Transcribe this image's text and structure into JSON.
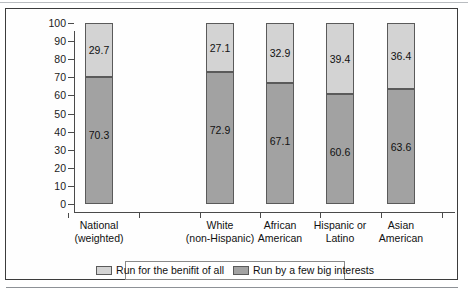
{
  "chart_data": {
    "type": "bar",
    "subtype": "stacked-100-percent",
    "title": "",
    "xlabel": "",
    "ylabel": "",
    "ylim": [
      0,
      100
    ],
    "y_ticks": [
      0,
      10,
      20,
      30,
      40,
      50,
      60,
      70,
      80,
      90,
      100
    ],
    "grid": false,
    "legend_position": "bottom",
    "categories": [
      "National (weighted)",
      "White (non-Hispanic)",
      "African American",
      "Hispanic or Latino",
      "Asian American"
    ],
    "category_lines": [
      [
        "National",
        "(weighted)"
      ],
      [
        "White",
        "(non-Hispanic)"
      ],
      [
        "African",
        "American"
      ],
      [
        "Hispanic or",
        "Latino"
      ],
      [
        "Asian",
        "American"
      ]
    ],
    "series": [
      {
        "name": "Run for the benifit of all",
        "color": "#d3d3d3",
        "values": [
          29.7,
          27.1,
          32.9,
          39.4,
          36.4
        ]
      },
      {
        "name": "Run by a few big interests",
        "color": "#a2a2a2",
        "values": [
          70.3,
          72.9,
          67.1,
          60.6,
          63.6
        ]
      }
    ]
  },
  "axis": {
    "y_tick_labels": [
      "100",
      "90",
      "80",
      "70",
      "60",
      "50",
      "40",
      "30",
      "20",
      "10",
      "0"
    ]
  },
  "legend": {
    "items": [
      {
        "label": "Run for the benifit of all",
        "swatch": "light"
      },
      {
        "label": "Run by a few big interests",
        "swatch": "dark"
      }
    ]
  },
  "colors": {
    "series_light": "#d3d3d3",
    "series_dark": "#a2a2a2",
    "axis": "#4a4a4a",
    "frame": "#3c3c3c",
    "text": "#111111"
  }
}
